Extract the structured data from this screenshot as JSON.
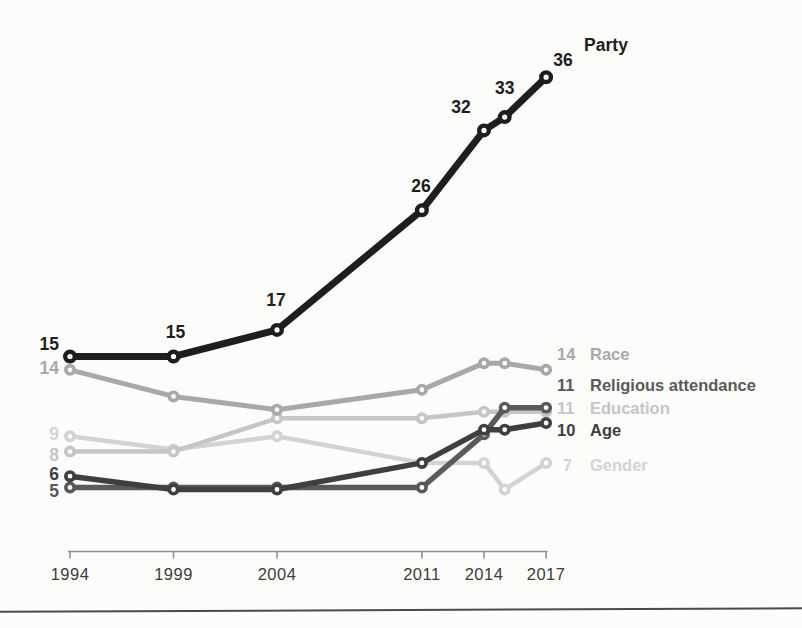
{
  "page": {
    "background_color": "#fcfcfb",
    "bottom_rule_color": "#4a4a4a"
  },
  "chart_data": {
    "type": "line",
    "title": "",
    "xlabel": "",
    "ylabel": "",
    "x_years": [
      1994,
      1999,
      2004,
      2011,
      2014,
      2015,
      2017
    ],
    "x_axis_tick_labels": [
      "1994",
      "1999",
      "2004",
      "2011",
      "2014",
      "2017"
    ],
    "ylim": [
      0,
      40
    ],
    "grid": false,
    "legend_position": "right-end-labels",
    "axis_color": "#909090",
    "year_label_color": "#3c3c3c",
    "series": [
      {
        "name": "Party",
        "color": "#1e1e1e",
        "values": [
          15,
          15,
          17,
          26,
          32,
          33,
          36
        ],
        "point_labels": [
          "15",
          "15",
          "17",
          "26",
          "32",
          "33",
          "36"
        ],
        "start_label": "15",
        "end_value_label": "",
        "end_name_label": "Party"
      },
      {
        "name": "Race",
        "color": "#a8a8a8",
        "values": [
          14,
          12,
          11,
          12.5,
          14.5,
          14.5,
          14
        ],
        "point_labels": [],
        "start_label": "14",
        "end_value_label": "14",
        "end_name_label": "Race"
      },
      {
        "name": "Religious attendance",
        "color": "#5a5a5a",
        "values": [
          5,
          5,
          5,
          5,
          9,
          11,
          11
        ],
        "point_labels": [],
        "start_label": "5",
        "end_value_label": "11",
        "end_name_label": "Religious attendance"
      },
      {
        "name": "Education",
        "color": "#c5c5c5",
        "values": [
          8,
          8,
          10.5,
          10.5,
          11,
          11,
          11
        ],
        "point_labels": [],
        "start_label": "8",
        "end_value_label": "11",
        "end_name_label": "Education"
      },
      {
        "name": "Age",
        "color": "#3f3f3f",
        "values": [
          6,
          5,
          5,
          7,
          9.5,
          9.5,
          10
        ],
        "point_labels": [],
        "start_label": "6",
        "end_value_label": "10",
        "end_name_label": "Age"
      },
      {
        "name": "Gender",
        "color": "#d3d3d3",
        "values": [
          9,
          8,
          9,
          7,
          7,
          5,
          7
        ],
        "point_labels": [],
        "start_label": "9",
        "end_value_label": "7",
        "end_name_label": "Gender"
      }
    ]
  }
}
